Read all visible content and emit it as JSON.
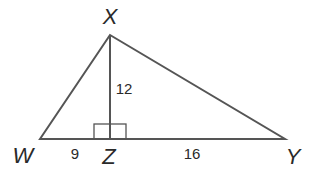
{
  "figure": {
    "type": "triangle-with-altitude",
    "vertices": {
      "X": {
        "label": "X",
        "x": 110,
        "y": 35
      },
      "W": {
        "label": "W",
        "x": 40,
        "y": 139
      },
      "Z": {
        "label": "Z",
        "x": 110,
        "y": 139
      },
      "Y": {
        "label": "Y",
        "x": 285,
        "y": 139
      }
    },
    "measurements": {
      "WZ": "9",
      "ZY": "16",
      "XZ": "12"
    },
    "right_angle_at": "Z",
    "colors": {
      "stroke": "#555555",
      "text": "#2a2a2a",
      "background": "#ffffff"
    }
  }
}
